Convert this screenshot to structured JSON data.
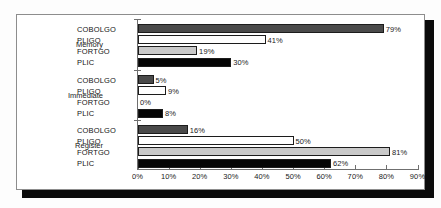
{
  "chart_data": {
    "type": "bar",
    "orientation": "horizontal",
    "title": "",
    "xlabel": "",
    "ylabel": "",
    "xlim": [
      0,
      90
    ],
    "xticks": [
      "0%",
      "10%",
      "20%",
      "30%",
      "40%",
      "50%",
      "60%",
      "70%",
      "80%",
      "90%"
    ],
    "xtick_values": [
      0,
      10,
      20,
      30,
      40,
      50,
      60,
      70,
      80,
      90
    ],
    "grid": false,
    "legend": "none",
    "categories": [
      "Memory",
      "Immediate",
      "Register"
    ],
    "series": [
      {
        "name": "COBOLGO",
        "values": [
          79,
          5,
          16
        ],
        "color": "#4a4a4a"
      },
      {
        "name": "PLIGO",
        "values": [
          41,
          9,
          50
        ],
        "color": "#ffffff"
      },
      {
        "name": "FORTGO",
        "values": [
          19,
          0,
          81
        ],
        "color": "#c9c9c9"
      },
      {
        "name": "PLIC",
        "values": [
          30,
          8,
          62
        ],
        "color": "#050505"
      }
    ],
    "groups": [
      {
        "category": "Memory",
        "bars": [
          {
            "series": "COBOLGO",
            "value": 79,
            "label": "79%",
            "fill": "fill-darkgray"
          },
          {
            "series": "PLIGO",
            "value": 41,
            "label": "41%",
            "fill": "fill-white"
          },
          {
            "series": "FORTGO",
            "value": 19,
            "label": "19%",
            "fill": "fill-lightgray"
          },
          {
            "series": "PLIC",
            "value": 30,
            "label": "30%",
            "fill": "fill-black"
          }
        ]
      },
      {
        "category": "Immediate",
        "bars": [
          {
            "series": "COBOLGO",
            "value": 5,
            "label": "5%",
            "fill": "fill-darkgray"
          },
          {
            "series": "PLIGO",
            "value": 9,
            "label": "9%",
            "fill": "fill-white"
          },
          {
            "series": "FORTGO",
            "value": 0,
            "label": "0%",
            "fill": "fill-lightgray"
          },
          {
            "series": "PLIC",
            "value": 8,
            "label": "8%",
            "fill": "fill-black"
          }
        ]
      },
      {
        "category": "Register",
        "bars": [
          {
            "series": "COBOLGO",
            "value": 16,
            "label": "16%",
            "fill": "fill-darkgray"
          },
          {
            "series": "PLIGO",
            "value": 50,
            "label": "50%",
            "fill": "fill-white"
          },
          {
            "series": "FORTGO",
            "value": 81,
            "label": "81%",
            "fill": "fill-lightgray"
          },
          {
            "series": "PLIC",
            "value": 62,
            "label": "62%",
            "fill": "fill-black"
          }
        ]
      }
    ]
  },
  "colors": {
    "axis": "#6f6f6f",
    "text": "#1a1a1a",
    "frame_border": "#8d8d8d",
    "shadow": "#0b0b0b",
    "background": "#ffffff"
  }
}
